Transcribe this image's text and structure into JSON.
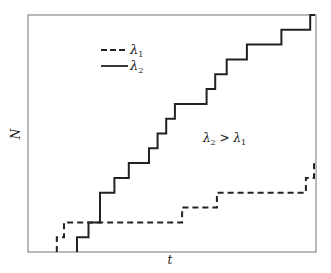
{
  "chart_data": {
    "type": "line",
    "subtype": "step",
    "title": "",
    "xlabel": "t",
    "ylabel": "N",
    "xlim": [
      0,
      1
    ],
    "ylim": [
      0,
      16
    ],
    "grid": false,
    "ticks": false,
    "legend": {
      "position": "upper-left",
      "entries": [
        {
          "label": "λ₁",
          "style": "dashed"
        },
        {
          "label": "λ₂",
          "style": "solid"
        }
      ]
    },
    "annotation": "λ₂ > λ₁",
    "series": [
      {
        "name": "λ₁",
        "style": "dashed",
        "color": "#222222",
        "jump_times": [
          0.1,
          0.125,
          0.535,
          0.656,
          0.965,
          0.993
        ],
        "counts_after": [
          1,
          2,
          3,
          4,
          5,
          6
        ]
      },
      {
        "name": "λ₂",
        "style": "solid",
        "color": "#222222",
        "jump_times": [
          0.17,
          0.21,
          0.25,
          0.3,
          0.35,
          0.42,
          0.45,
          0.48,
          0.51,
          0.62,
          0.65,
          0.69,
          0.76,
          0.88,
          0.98
        ],
        "counts_after": [
          1,
          2,
          4,
          5,
          6,
          7,
          8,
          9,
          10,
          11,
          12,
          13,
          14,
          15,
          16
        ]
      }
    ]
  },
  "labels": {
    "x_axis": "t",
    "y_axis": "N",
    "legend_1": "λ",
    "legend_1_sub": "1",
    "legend_2": "λ",
    "legend_2_sub": "2",
    "annotation_a": "λ",
    "annotation_a_sub": "2",
    "annotation_op": " > ",
    "annotation_b": "λ",
    "annotation_b_sub": "1"
  },
  "colors": {
    "frame": "#8a8a8a",
    "line": "#222222"
  }
}
